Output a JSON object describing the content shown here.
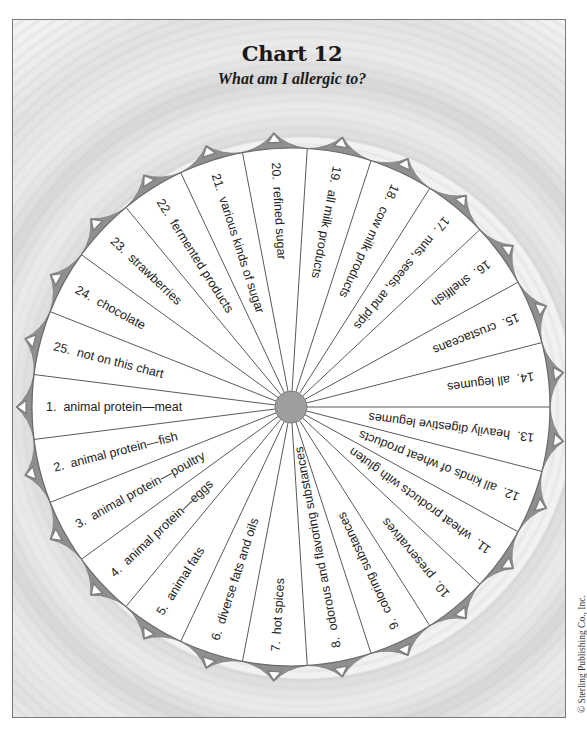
{
  "header": {
    "title": "Chart 12",
    "subtitle": "What am I allergic to?"
  },
  "footer": {
    "copyright": "© Sterling Publishing Co., Inc."
  },
  "colors": {
    "wheel_fill": "#ffffff",
    "spoke": "#5a5a5a",
    "rim_band": "#8f8f8f",
    "center_disk": "#9e9e9e",
    "label_text": "#222222",
    "background": "#efefef"
  },
  "wheel": {
    "center": [
      291,
      407
    ],
    "radius": 259,
    "sector_count": 25,
    "sectors": [
      {
        "number": "1.",
        "label": "animal protein—meat"
      },
      {
        "number": "2.",
        "label": "animal protein—fish"
      },
      {
        "number": "3.",
        "label": "animal protein—poultry"
      },
      {
        "number": "4.",
        "label": "animal protein—eggs"
      },
      {
        "number": "5.",
        "label": "animal fats"
      },
      {
        "number": "6.",
        "label": "diverse fats and oils"
      },
      {
        "number": "7.",
        "label": "hot spices"
      },
      {
        "number": "8.",
        "label": "odorous and flavoring substances"
      },
      {
        "number": "9.",
        "label": "coloring substances"
      },
      {
        "number": "10.",
        "label": "preservatives"
      },
      {
        "number": "11.",
        "label": "wheat products with gluten"
      },
      {
        "number": "12.",
        "label": "all kinds of wheat products"
      },
      {
        "number": "13.",
        "label": "heavily digestive legumes"
      },
      {
        "number": "14.",
        "label": "all legumes"
      },
      {
        "number": "15.",
        "label": "crustaceans"
      },
      {
        "number": "16.",
        "label": "shellfish"
      },
      {
        "number": "17.",
        "label": "nuts, seeds, and pips"
      },
      {
        "number": "18.",
        "label": "cow milk products"
      },
      {
        "number": "19.",
        "label": "all milk products"
      },
      {
        "number": "20.",
        "label": "refined sugar"
      },
      {
        "number": "21.",
        "label": "various kinds of sugar"
      },
      {
        "number": "22.",
        "label": "fermented products"
      },
      {
        "number": "23.",
        "label": "strawberries"
      },
      {
        "number": "24.",
        "label": "chocolate"
      },
      {
        "number": "25.",
        "label": "not on this chart"
      }
    ]
  }
}
